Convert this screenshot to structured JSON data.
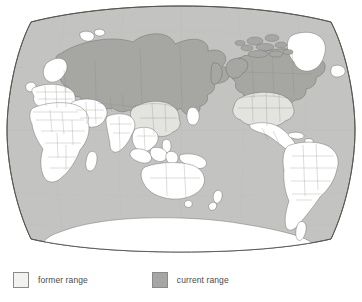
{
  "figure": {
    "kind": "world-map",
    "projection": "van-der-grinten-oval",
    "center": "pacific-centered",
    "background_color": "#ffffff"
  },
  "map": {
    "ocean_color": "#c3c3c1",
    "graticule_color": "#b6b6b4",
    "outline_color": "#55544f",
    "border_color": "#6b6b66",
    "land_default_color": "#ffffff",
    "former_range_color": "#e2e2df",
    "current_range_color": "#a6a6a4",
    "regions": [
      {
        "name": "greenland",
        "fill": "none"
      },
      {
        "name": "iceland",
        "fill": "none"
      },
      {
        "name": "scandinavia",
        "fill": "none"
      },
      {
        "name": "europe",
        "fill": "none"
      },
      {
        "name": "africa",
        "fill": "none"
      },
      {
        "name": "madagascar",
        "fill": "none"
      },
      {
        "name": "middle-east",
        "fill": "none"
      },
      {
        "name": "india",
        "fill": "none"
      },
      {
        "name": "southeast-asia",
        "fill": "none"
      },
      {
        "name": "indonesia",
        "fill": "none"
      },
      {
        "name": "australia",
        "fill": "none"
      },
      {
        "name": "new-zealand",
        "fill": "none"
      },
      {
        "name": "japan",
        "fill": "none"
      },
      {
        "name": "antarctica",
        "fill": "none"
      },
      {
        "name": "central-america",
        "fill": "none"
      },
      {
        "name": "south-america",
        "fill": "none"
      },
      {
        "name": "russia-siberia",
        "fill": "current"
      },
      {
        "name": "central-asia",
        "fill": "current"
      },
      {
        "name": "canada",
        "fill": "current"
      },
      {
        "name": "alaska",
        "fill": "current"
      },
      {
        "name": "china",
        "fill": "former"
      },
      {
        "name": "united-states",
        "fill": "former"
      }
    ]
  },
  "legend": {
    "items": [
      {
        "label": "former range",
        "swatch": "former-range-swatch",
        "color": "#f2f2f0"
      },
      {
        "label": "current range",
        "swatch": "current-range-swatch",
        "color": "#a6a6a4"
      }
    ]
  }
}
